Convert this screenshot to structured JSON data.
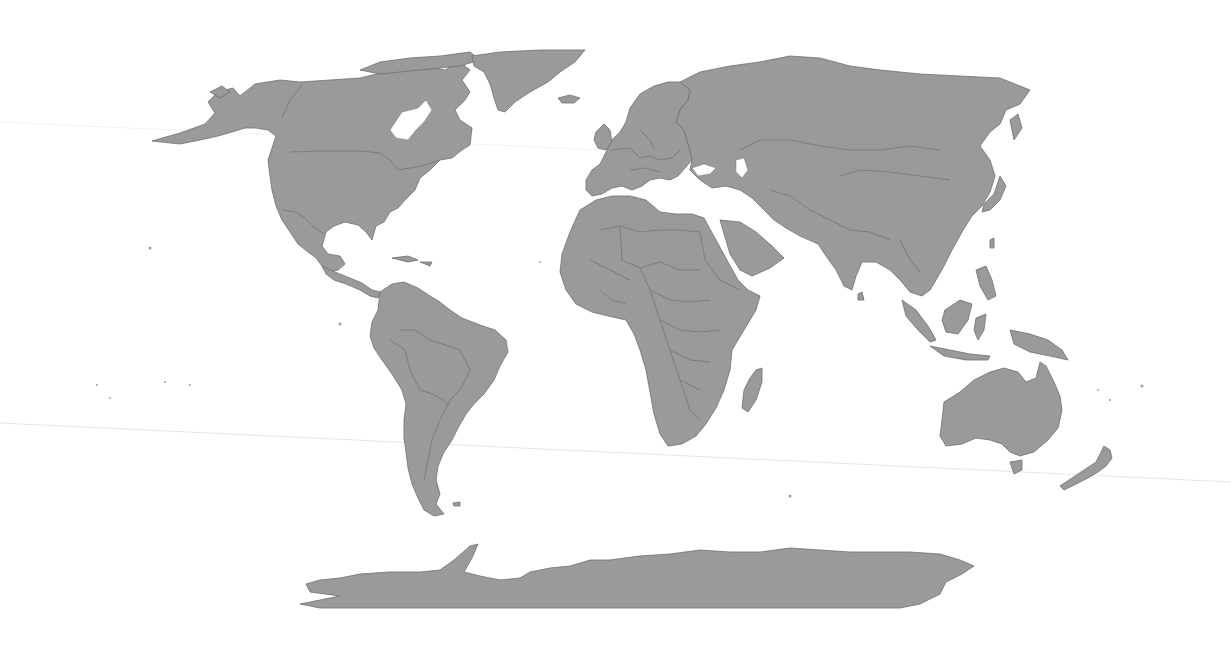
{
  "map": {
    "projection": "robinson-like world projection",
    "title": "",
    "land_color": "#9a9a9a",
    "border_color": "#6f6f6f",
    "ocean_color": "#ffffff",
    "regions": [
      {
        "id": "north-america",
        "label": "North America"
      },
      {
        "id": "greenland",
        "label": "Greenland"
      },
      {
        "id": "south-america",
        "label": "South America"
      },
      {
        "id": "europe",
        "label": "Europe"
      },
      {
        "id": "africa",
        "label": "Africa"
      },
      {
        "id": "asia",
        "label": "Asia"
      },
      {
        "id": "australia",
        "label": "Australia"
      },
      {
        "id": "new-zealand",
        "label": "New Zealand"
      },
      {
        "id": "antarctica",
        "label": "Antarctica"
      },
      {
        "id": "madagascar",
        "label": "Madagascar"
      },
      {
        "id": "japan",
        "label": "Japan"
      },
      {
        "id": "southeast-asia-islands",
        "label": "Maritime Southeast Asia"
      }
    ]
  }
}
